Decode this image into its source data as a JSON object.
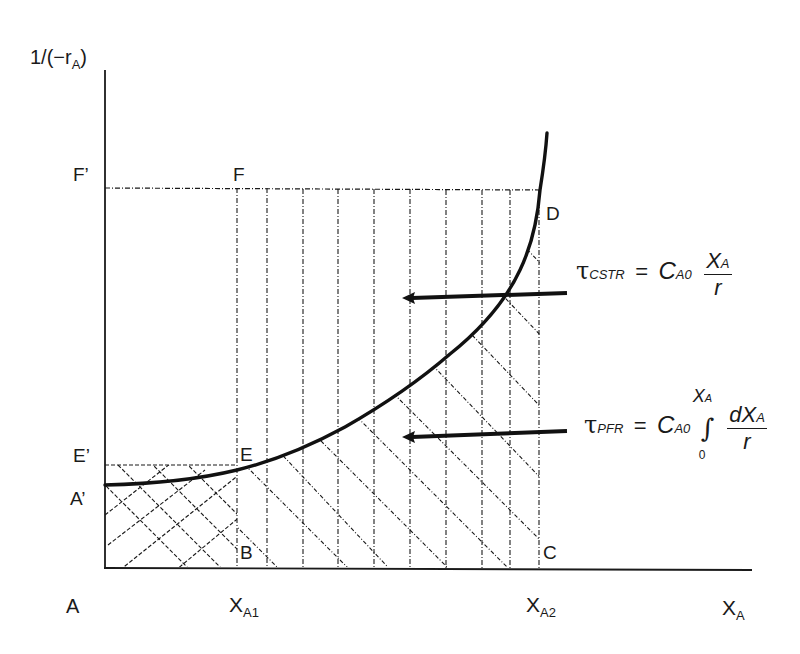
{
  "diagram": {
    "y_axis_label": {
      "main": "1/(−r",
      "sub": "A",
      "close": ")"
    },
    "x_axis_label": {
      "main": "X",
      "sub": "A"
    },
    "origin_label": "A",
    "points": {
      "A_prime": "A’",
      "E_prime": "E’",
      "F_prime": "F’",
      "F": "F",
      "E": "E",
      "D": "D",
      "B": "B",
      "C": "C"
    },
    "x_ticks": [
      {
        "main": "X",
        "sub": "A1"
      },
      {
        "main": "X",
        "sub": "A2"
      }
    ],
    "equations": {
      "cstr": {
        "tau": "τ",
        "tau_sub": "CSTR",
        "equals": "=",
        "coef": "C",
        "coef_sub": "A0",
        "numerator_main": "X",
        "numerator_sub": "A",
        "denominator": "r"
      },
      "pfr": {
        "tau": "τ",
        "tau_sub": "PFR",
        "equals": "=",
        "coef": "C",
        "coef_sub": "A0",
        "integral_symbol": "∫",
        "upper_main": "X",
        "upper_sub": "A",
        "lower": "0",
        "numerator_main": "dX",
        "numerator_sub": "A",
        "denominator": "r"
      }
    },
    "regions": {
      "cstr_area": "Rectangle A'–F'–F–D–C–B region (vertical dash-dot hatching) representing CSTR volume",
      "pfr_area": "Area under curve from X_A1 to X_A2 (diagonal hatching) representing PFR volume"
    },
    "colors": {
      "ink": "#1a1a1a",
      "background": "#ffffff"
    }
  }
}
